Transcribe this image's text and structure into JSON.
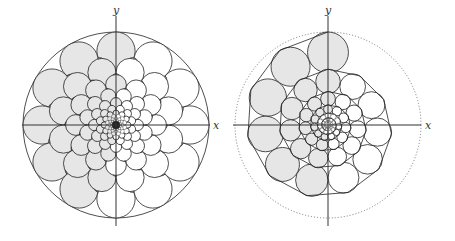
{
  "figure": {
    "left": {
      "title": "Circle packing (rotationally symmetric)",
      "x_label": "x",
      "y_label": "y",
      "center": [
        116,
        125
      ],
      "outer_radius": 93,
      "rings": 12,
      "colors": {
        "light": "#e6e6e6",
        "dark": "#8c8c8c",
        "mid": "#c4c4c4",
        "white": "#ffffff",
        "stroke": "#222222"
      }
    },
    "right": {
      "title": "Spiral circle packing",
      "x_label": "x",
      "y_label": "y",
      "center": [
        328,
        125
      ],
      "outer_radius": 93,
      "dotted_radius": 93,
      "colors": {
        "light": "#e6e6e6",
        "white": "#ffffff",
        "stroke": "#222222",
        "dotted": "#777777"
      }
    }
  }
}
